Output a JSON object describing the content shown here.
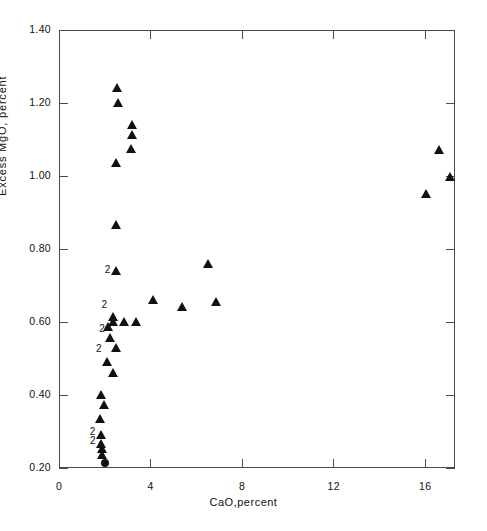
{
  "chart_data": {
    "type": "scatter",
    "title": "",
    "xlabel": "CaO,percent",
    "ylabel": "Excess MgO, percent",
    "xlim": [
      0,
      17.3
    ],
    "ylim": [
      0.2,
      1.4
    ],
    "xticks": [
      0,
      4,
      8,
      12,
      16
    ],
    "xtick_labels": [
      "0",
      "4",
      "8",
      "12",
      "16"
    ],
    "yticks": [
      0.2,
      0.4,
      0.6,
      0.8,
      1.0,
      1.2,
      1.4
    ],
    "ytick_labels": [
      "0.20",
      "0.40",
      "0.60",
      "0.80",
      "1.00",
      "1.20",
      "1.40"
    ],
    "grid": false,
    "legend": null,
    "marker_note": "Labels '2' next to a marker indicate two coincident observations at that location",
    "series": [
      {
        "name": "observations",
        "marker": "triangle",
        "color": "#111111",
        "points": [
          {
            "x": 2.52,
            "y": 1.24,
            "count": 1
          },
          {
            "x": 2.58,
            "y": 1.199,
            "count": 1
          },
          {
            "x": 3.2,
            "y": 1.139,
            "count": 1
          },
          {
            "x": 3.2,
            "y": 1.112,
            "count": 1
          },
          {
            "x": 3.16,
            "y": 1.074,
            "count": 1
          },
          {
            "x": 2.48,
            "y": 1.036,
            "count": 1
          },
          {
            "x": 2.48,
            "y": 0.866,
            "count": 1
          },
          {
            "x": 2.48,
            "y": 0.74,
            "count": 2
          },
          {
            "x": 6.52,
            "y": 0.76,
            "count": 1
          },
          {
            "x": 4.1,
            "y": 0.66,
            "count": 1
          },
          {
            "x": 6.84,
            "y": 0.655,
            "count": 1
          },
          {
            "x": 5.38,
            "y": 0.64,
            "count": 1
          },
          {
            "x": 2.34,
            "y": 0.615,
            "count": 2
          },
          {
            "x": 2.38,
            "y": 0.6,
            "count": 1
          },
          {
            "x": 2.84,
            "y": 0.6,
            "count": 1
          },
          {
            "x": 3.36,
            "y": 0.6,
            "count": 1
          },
          {
            "x": 2.14,
            "y": 0.585,
            "count": 1
          },
          {
            "x": 2.24,
            "y": 0.555,
            "count": 2
          },
          {
            "x": 2.48,
            "y": 0.53,
            "count": 1
          },
          {
            "x": 2.1,
            "y": 0.49,
            "count": 2
          },
          {
            "x": 2.38,
            "y": 0.46,
            "count": 1
          },
          {
            "x": 1.84,
            "y": 0.4,
            "count": 1
          },
          {
            "x": 1.98,
            "y": 0.372,
            "count": 1
          },
          {
            "x": 1.8,
            "y": 0.334,
            "count": 1
          },
          {
            "x": 1.82,
            "y": 0.29,
            "count": 2
          },
          {
            "x": 1.84,
            "y": 0.266,
            "count": 2
          },
          {
            "x": 1.88,
            "y": 0.252,
            "count": 1
          },
          {
            "x": 1.88,
            "y": 0.236,
            "count": 1
          },
          {
            "x": 16.02,
            "y": 0.95,
            "count": 1
          },
          {
            "x": 16.6,
            "y": 1.07,
            "count": 1
          },
          {
            "x": 17.1,
            "y": 0.998,
            "count": 1
          }
        ]
      },
      {
        "name": "observations-circle",
        "marker": "circle",
        "color": "#111111",
        "points": [
          {
            "x": 2.02,
            "y": 0.215,
            "count": 1
          }
        ]
      }
    ],
    "duplicate_labels": [
      {
        "x": 2.48,
        "y": 0.74,
        "text": "2"
      },
      {
        "x": 2.34,
        "y": 0.645,
        "text": "2"
      },
      {
        "x": 2.24,
        "y": 0.578,
        "text": "2"
      },
      {
        "x": 2.1,
        "y": 0.522,
        "text": "2"
      },
      {
        "x": 1.82,
        "y": 0.296,
        "text": "2"
      },
      {
        "x": 1.84,
        "y": 0.272,
        "text": "2"
      }
    ]
  }
}
